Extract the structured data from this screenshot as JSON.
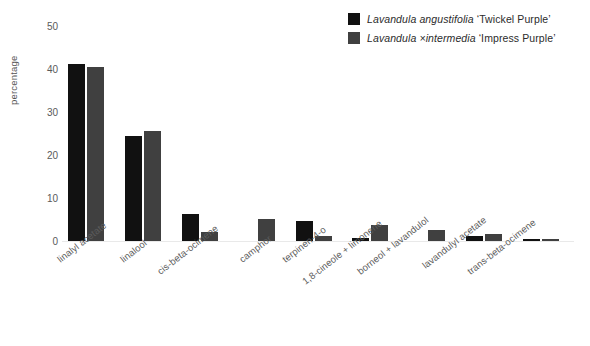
{
  "chart_data": {
    "type": "bar",
    "title": "",
    "xlabel": "",
    "ylabel": "percentage",
    "ylim": [
      0,
      50
    ],
    "yticks": [
      50,
      40,
      30,
      20,
      10,
      0
    ],
    "grid": false,
    "legend_position": "top-right",
    "categories": [
      "linalyl acetate",
      "linalool",
      "cis-beta-ocimene",
      "camphor",
      "terpinen-4-o",
      "1,8-cineole + limonene",
      "borneol + lavandulol",
      "lavandulyl acetate",
      "trans-beta-ocimene"
    ],
    "series": [
      {
        "name": "Lavandula angustifolia 'Twickel Purple'",
        "name_parts": {
          "genus": "Lavandula",
          "species": "angustifolia",
          "cultivar": "‘Twickel Purple’"
        },
        "color": "#111111",
        "values": [
          41.2,
          24.4,
          6.3,
          0,
          4.7,
          0.8,
          0,
          1.2,
          0.5
        ]
      },
      {
        "name": "Lavandula ×intermedia 'Impress Purple'",
        "name_parts": {
          "genus": "Lavandula",
          "species": "×intermedia",
          "cultivar": "‘Impress Purple’"
        },
        "color": "#404040",
        "values": [
          40.5,
          25.6,
          2.1,
          5.2,
          1.2,
          3.7,
          2.5,
          1.6,
          0.4
        ]
      }
    ]
  },
  "legend": {
    "entries": [
      {
        "genus": "Lavandula",
        "species": "angustifolia",
        "cultivar": "‘Twickel Purple’",
        "color": "#111111"
      },
      {
        "genus": "Lavandula",
        "species": "×intermedia",
        "cultivar": "‘Impress Purple’",
        "color": "#404040"
      }
    ]
  },
  "axes": {
    "y_title": "percentage",
    "y_tick_labels": [
      "50",
      "40",
      "30",
      "20",
      "10",
      "0"
    ]
  }
}
